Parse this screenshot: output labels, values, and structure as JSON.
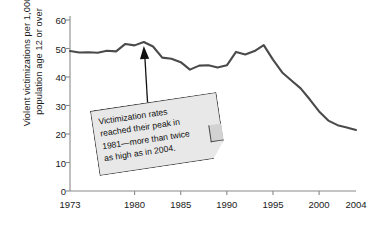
{
  "chart_data": {
    "type": "line",
    "title": "",
    "subtitle": "",
    "xlabel": "",
    "ylabel": "Violent victimizations per 1,000\npopulation age 12 or over",
    "xlim": [
      1973,
      2004
    ],
    "ylim": [
      0,
      60
    ],
    "grid": false,
    "legend": "none",
    "ytick_labels": [
      "0",
      "10",
      "20",
      "30",
      "40",
      "50",
      "60"
    ],
    "ytick_values": [
      0,
      10,
      20,
      30,
      40,
      50,
      60
    ],
    "xtick_labels": [
      "1973",
      "1980",
      "1985",
      "1990",
      "1995",
      "2000",
      "2004"
    ],
    "xtick_values": [
      1973,
      1980,
      1985,
      1990,
      1995,
      2000,
      2004
    ],
    "line_color": "#4a4a4a",
    "x": [
      1973,
      1974,
      1975,
      1976,
      1977,
      1978,
      1979,
      1980,
      1981,
      1982,
      1983,
      1984,
      1985,
      1986,
      1987,
      1988,
      1989,
      1990,
      1991,
      1992,
      1993,
      1994,
      1995,
      1996,
      1997,
      1998,
      1999,
      2000,
      2001,
      2002,
      2003,
      2004
    ],
    "values": [
      49.1,
      48.6,
      48.7,
      48.5,
      49.2,
      49.0,
      51.6,
      51.1,
      52.3,
      50.7,
      46.8,
      46.4,
      45.2,
      42.6,
      44.0,
      44.1,
      43.3,
      44.1,
      48.8,
      47.9,
      49.1,
      51.2,
      46.1,
      41.6,
      38.8,
      36.0,
      32.1,
      27.9,
      24.7,
      23.1,
      22.3,
      21.4
    ],
    "annotation": {
      "text": "Victimization rates\nreached their peak in\n1981—more than twice\nas high as in 2004.",
      "points_to_x": 1981,
      "points_to_y": 52.3,
      "box_fill": "#e8e8e8",
      "box_border": "#4a4a4a"
    }
  }
}
